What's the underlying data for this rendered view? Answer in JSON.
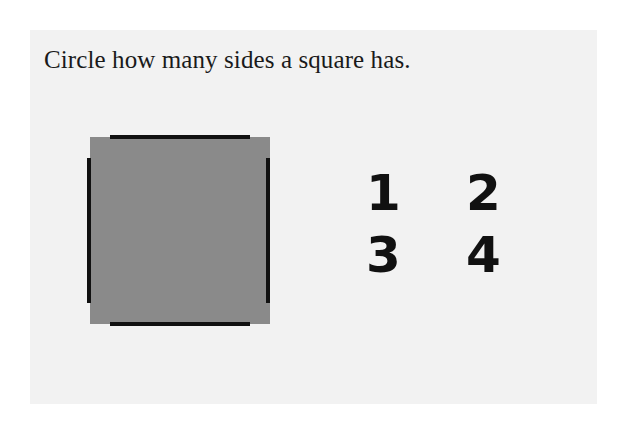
{
  "worksheet": {
    "prompt": "Circle how many sides a square has.",
    "shape": {
      "name": "square",
      "fill_color": "#8a8a8a",
      "edge_color": "#111111",
      "edges": [
        "top",
        "right",
        "bottom",
        "left"
      ]
    },
    "choices": [
      {
        "label": "1"
      },
      {
        "label": "2"
      },
      {
        "label": "3"
      },
      {
        "label": "4"
      }
    ]
  }
}
